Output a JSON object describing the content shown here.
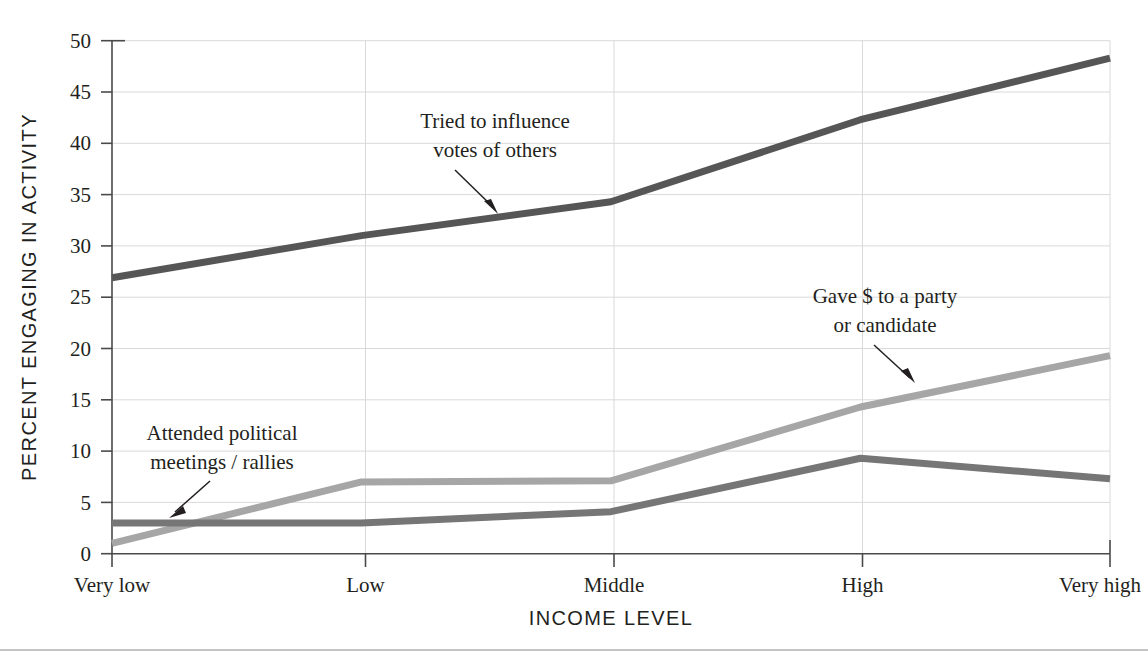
{
  "chart_data": {
    "type": "line",
    "title": "",
    "xlabel": "INCOME LEVEL",
    "ylabel": "PERCENT ENGAGING IN ACTIVITY",
    "categories": [
      "Very low",
      "Low",
      "Middle",
      "High",
      "Very high"
    ],
    "ylim": [
      0,
      50
    ],
    "yticks": [
      0,
      5,
      10,
      15,
      20,
      25,
      30,
      35,
      40,
      45,
      50
    ],
    "ytick_labels": [
      "0",
      "5",
      "10",
      "15",
      "20",
      "25",
      "30",
      "35",
      "40",
      "45",
      "50"
    ],
    "grid": true,
    "legend_position": "annotations",
    "series": [
      {
        "name": "Tried to influence votes of others",
        "color": "#565656",
        "values": [
          26.9,
          31.0,
          34.3,
          42.3,
          48.3
        ]
      },
      {
        "name": "Gave $ to a party or candidate",
        "color": "#a6a6a6",
        "values": [
          1.0,
          7.0,
          7.1,
          14.3,
          19.3
        ]
      },
      {
        "name": "Attended political meetings/rallies",
        "color": "#767676",
        "values": [
          3.0,
          3.0,
          4.1,
          9.3,
          7.3
        ]
      }
    ],
    "annotations": [
      {
        "id": "influence",
        "lines": [
          "Tried to influence",
          "votes of others"
        ],
        "text_x": 495,
        "text_y": 128,
        "arrow": {
          "x1": 455,
          "y1": 157,
          "x2": 498,
          "y2": 196
        }
      },
      {
        "id": "gave-money",
        "lines": [
          "Gave $ to a party",
          "or candidate"
        ],
        "text_x": 885,
        "text_y": 303,
        "arrow": {
          "x1": 875,
          "y1": 333,
          "x2": 915,
          "y2": 381
        }
      },
      {
        "id": "attended-meetings",
        "lines": [
          "Attended political",
          "meetings / rallies"
        ],
        "text_x": 222,
        "text_y": 440,
        "arrow": {
          "x1": 210,
          "y1": 468,
          "x2": 170,
          "y2": 508
        }
      }
    ]
  },
  "colors": {
    "background": "#ffffff",
    "grid": "#d9d9d9",
    "axis": "#4a4a4a",
    "text": "#231f20",
    "series_dark": "#565656",
    "series_light": "#a6a6a6",
    "series_medium": "#767676"
  }
}
